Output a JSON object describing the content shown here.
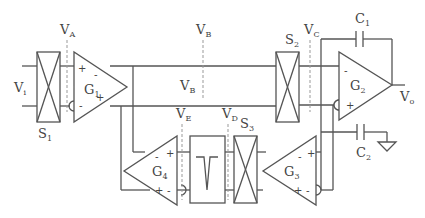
{
  "diagram": {
    "type": "circuit-schematic",
    "stroke_color": "#555555",
    "labels": {
      "vi": {
        "main": "V",
        "sub": "i"
      },
      "va": {
        "main": "V",
        "sub": "A"
      },
      "vb_top": {
        "main": "V",
        "sub": "B"
      },
      "vb_mid": {
        "main": "V",
        "sub": "B"
      },
      "vc": {
        "main": "V",
        "sub": "C"
      },
      "vd": {
        "main": "V",
        "sub": "D"
      },
      "ve": {
        "main": "V",
        "sub": "E"
      },
      "vo": {
        "main": "V",
        "sub": "o"
      },
      "s1": {
        "main": "S",
        "sub": "1"
      },
      "s2": {
        "main": "S",
        "sub": "2"
      },
      "s3": {
        "main": "S",
        "sub": "3"
      },
      "c1": {
        "main": "C",
        "sub": "1"
      },
      "c2": {
        "main": "C",
        "sub": "2"
      },
      "g1": {
        "main": "G",
        "sub": "1"
      },
      "g2": {
        "main": "G",
        "sub": "2"
      },
      "g3": {
        "main": "G",
        "sub": "3"
      },
      "g4": {
        "main": "G",
        "sub": "4"
      }
    },
    "signs": {
      "plus": "+",
      "minus": "-"
    }
  }
}
